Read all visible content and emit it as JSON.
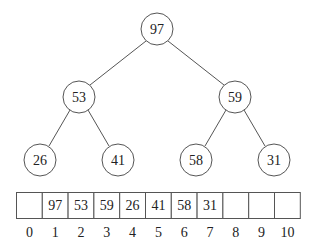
{
  "diagram": {
    "type": "binary-heap",
    "tree": {
      "nodes": [
        {
          "id": "n1",
          "value": "97",
          "cx": 157,
          "cy": 29
        },
        {
          "id": "n2",
          "value": "53",
          "cx": 79,
          "cy": 97
        },
        {
          "id": "n3",
          "value": "59",
          "cx": 235,
          "cy": 97
        },
        {
          "id": "n4",
          "value": "26",
          "cx": 40,
          "cy": 160
        },
        {
          "id": "n5",
          "value": "41",
          "cx": 118,
          "cy": 160
        },
        {
          "id": "n6",
          "value": "58",
          "cx": 196,
          "cy": 160
        },
        {
          "id": "n7",
          "value": "31",
          "cx": 274,
          "cy": 160
        }
      ],
      "edges": [
        [
          "n1",
          "n2"
        ],
        [
          "n1",
          "n3"
        ],
        [
          "n2",
          "n4"
        ],
        [
          "n2",
          "n5"
        ],
        [
          "n3",
          "n6"
        ],
        [
          "n3",
          "n7"
        ]
      ],
      "radius": 16
    },
    "array": {
      "cells": [
        "",
        "97",
        "53",
        "59",
        "26",
        "41",
        "58",
        "31",
        "",
        "",
        ""
      ],
      "indices": [
        "0",
        "1",
        "2",
        "3",
        "4",
        "5",
        "6",
        "7",
        "8",
        "9",
        "10"
      ],
      "x": 16,
      "y": 192,
      "cell_width": 25.8,
      "cell_height": 26
    },
    "colors": {
      "stroke": "#555555",
      "text": "#222222",
      "background": "#ffffff"
    }
  }
}
